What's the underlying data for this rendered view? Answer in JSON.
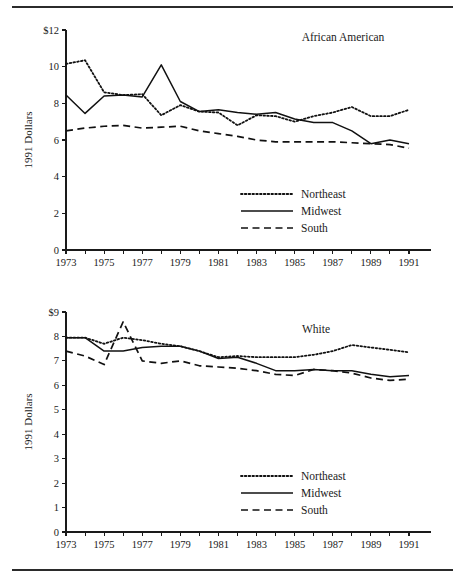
{
  "figure": {
    "rule_top": "horizontal-rule",
    "rule_bottom": "horizontal-rule"
  },
  "chart_data": [
    {
      "type": "line",
      "title": "African American",
      "xlabel": "",
      "ylabel": "1991 Dollars",
      "xlim": [
        1973,
        1991
      ],
      "ylim": [
        0,
        12
      ],
      "ytick_values": [
        0,
        2,
        4,
        6,
        8,
        10,
        12
      ],
      "ytick_labels": [
        "0",
        "2",
        "4",
        "6",
        "8",
        "10",
        "$12"
      ],
      "x": [
        1973,
        1974,
        1975,
        1976,
        1977,
        1978,
        1979,
        1980,
        1981,
        1982,
        1983,
        1984,
        1985,
        1986,
        1987,
        1988,
        1989,
        1990,
        1991
      ],
      "xtick_values": [
        1973,
        1974,
        1975,
        1976,
        1977,
        1978,
        1979,
        1980,
        1981,
        1982,
        1983,
        1984,
        1985,
        1986,
        1987,
        1988,
        1989,
        1990,
        1991
      ],
      "xtick_labels": [
        "1973",
        "",
        "1975",
        "",
        "1977",
        "",
        "1979",
        "",
        "1981",
        "",
        "1983",
        "",
        "1985",
        "",
        "1987",
        "",
        "1989",
        "",
        "1991"
      ],
      "grid": false,
      "legend_position": "lower-center-right",
      "series": [
        {
          "name": "Northeast",
          "style": "dotted",
          "values": [
            10.15,
            10.35,
            8.6,
            8.45,
            8.5,
            7.35,
            7.9,
            7.55,
            7.5,
            6.8,
            7.35,
            7.3,
            7.0,
            7.3,
            7.5,
            7.8,
            7.3,
            7.3,
            7.65
          ]
        },
        {
          "name": "Midwest",
          "style": "solid",
          "values": [
            8.45,
            7.45,
            8.4,
            8.45,
            8.35,
            10.1,
            8.1,
            7.55,
            7.65,
            7.5,
            7.4,
            7.5,
            7.15,
            6.95,
            6.95,
            6.5,
            5.8,
            6.0,
            5.8
          ]
        },
        {
          "name": "South",
          "style": "dashed",
          "values": [
            6.5,
            6.65,
            6.75,
            6.8,
            6.65,
            6.7,
            6.75,
            6.5,
            6.35,
            6.2,
            6.0,
            5.9,
            5.9,
            5.9,
            5.9,
            5.85,
            5.8,
            5.75,
            5.55
          ]
        }
      ]
    },
    {
      "type": "line",
      "title": "White",
      "xlabel": "",
      "ylabel": "1991 Dollars",
      "xlim": [
        1973,
        1991
      ],
      "ylim": [
        0,
        9
      ],
      "ytick_values": [
        0,
        1,
        2,
        3,
        4,
        5,
        6,
        7,
        8,
        9
      ],
      "ytick_labels": [
        "0",
        "1",
        "2",
        "3",
        "4",
        "5",
        "6",
        "7",
        "8",
        "$9"
      ],
      "x": [
        1973,
        1974,
        1975,
        1976,
        1977,
        1978,
        1979,
        1980,
        1981,
        1982,
        1983,
        1984,
        1985,
        1986,
        1987,
        1988,
        1989,
        1990,
        1991
      ],
      "xtick_values": [
        1973,
        1974,
        1975,
        1976,
        1977,
        1978,
        1979,
        1980,
        1981,
        1982,
        1983,
        1984,
        1985,
        1986,
        1987,
        1988,
        1989,
        1990,
        1991
      ],
      "xtick_labels": [
        "1973",
        "",
        "1975",
        "",
        "1977",
        "",
        "1979",
        "",
        "1981",
        "",
        "1983",
        "",
        "1985",
        "",
        "1987",
        "",
        "1989",
        "",
        "1991"
      ],
      "grid": false,
      "legend_position": "lower-center-right",
      "series": [
        {
          "name": "Northeast",
          "style": "dotted",
          "values": [
            7.95,
            7.95,
            7.7,
            7.95,
            7.85,
            7.7,
            7.6,
            7.4,
            7.15,
            7.2,
            7.15,
            7.15,
            7.15,
            7.25,
            7.4,
            7.65,
            7.55,
            7.45,
            7.35
          ]
        },
        {
          "name": "Midwest",
          "style": "solid",
          "values": [
            7.95,
            7.95,
            7.4,
            7.4,
            7.55,
            7.6,
            7.6,
            7.4,
            7.1,
            7.15,
            6.9,
            6.6,
            6.6,
            6.65,
            6.6,
            6.6,
            6.45,
            6.35,
            6.4
          ]
        },
        {
          "name": "South",
          "style": "dashed",
          "values": [
            7.4,
            7.2,
            6.85,
            8.6,
            7.0,
            6.9,
            7.0,
            6.8,
            6.75,
            6.7,
            6.6,
            6.45,
            6.4,
            6.65,
            6.6,
            6.5,
            6.3,
            6.2,
            6.25
          ]
        }
      ]
    }
  ]
}
